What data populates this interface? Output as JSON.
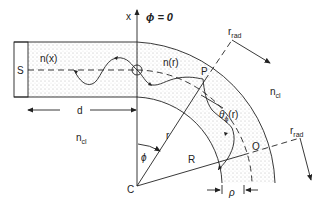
{
  "diagram": {
    "labels": {
      "source": "S",
      "axis_x": "x",
      "phi_zero": "ϕ = 0",
      "n_straight": "n(x)",
      "n_bent": "n(r)",
      "point_P": "P",
      "r_rad_main": "r",
      "r_rad_sub": "rad",
      "r_rad2_main": "r",
      "r_rad2_sub": "rad",
      "n_cl_right_main": "n",
      "n_cl_right_sub": "cl",
      "n_cl_left_main": "n",
      "n_cl_left_sub": "cl",
      "d": "d",
      "theta_main": "θ",
      "theta_sub": "ϕ",
      "theta_arg": "(r)",
      "radius_r": "r",
      "radius_R": "R",
      "angle_phi": "ϕ",
      "center": "C",
      "point_O": "O",
      "rho": "ρ"
    }
  }
}
